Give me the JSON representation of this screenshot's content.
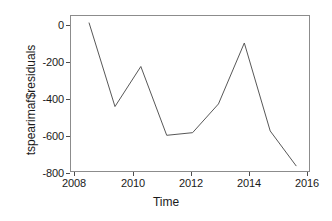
{
  "chart_data": {
    "type": "line",
    "title": "",
    "subtitle": "",
    "xlabel": "Time",
    "ylabel": "tspearimaf$residuals",
    "x": [
      2008,
      2009,
      2010,
      2011,
      2012,
      2013,
      2014,
      2015,
      2016
    ],
    "values": [
      20,
      -460,
      -230,
      -625,
      -610,
      -445,
      -95,
      -600,
      -800
    ],
    "series": [
      {
        "name": "tspearimaf$residuals",
        "values": [
          20,
          -460,
          -230,
          -625,
          -610,
          -445,
          -95,
          -600,
          -800
        ]
      }
    ],
    "xlim": [
      2007.3,
      2016.5
    ],
    "ylim": [
      -830,
      60
    ],
    "xticks": [
      2008,
      2010,
      2012,
      2014,
      2016
    ],
    "xticklabels": [
      "2008",
      "2010",
      "2012",
      "2014",
      "2016"
    ],
    "yticks": [
      0,
      -200,
      -400,
      -600,
      -800
    ],
    "yticklabels": [
      "0",
      "-200",
      "-400",
      "-600",
      "-800"
    ],
    "grid": false,
    "legend": false,
    "legend_position": "none",
    "line_color": "#555555",
    "background_color": "#ffffff",
    "frame": true
  }
}
